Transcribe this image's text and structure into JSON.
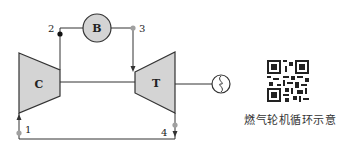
{
  "diagram": {
    "title": "燃气轮机循环示意",
    "components": {
      "compressor": {
        "label": "C"
      },
      "burner": {
        "label": "B"
      },
      "turbine": {
        "label": "T"
      },
      "generator": {
        "label": "generator"
      }
    },
    "state_points": [
      "1",
      "2",
      "3",
      "4"
    ],
    "colors": {
      "fill": "#d4d4d4",
      "line": "#333333",
      "node_gray": "#a0a0a0",
      "node_black": "#111111"
    }
  },
  "qr": {
    "label": "QR code"
  }
}
